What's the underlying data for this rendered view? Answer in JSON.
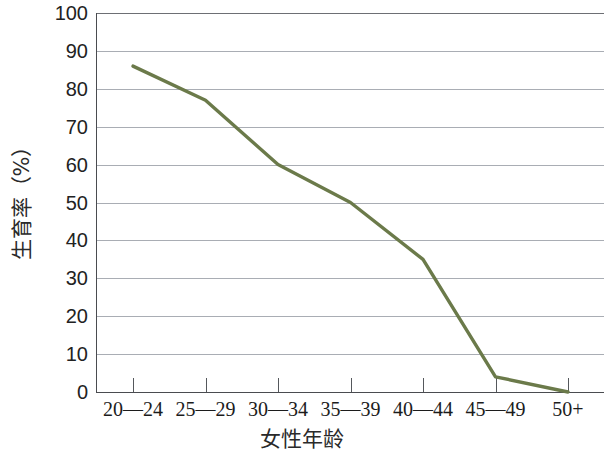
{
  "chart_data": {
    "type": "line",
    "title": "",
    "xlabel": "女性年龄",
    "ylabel": "生育率（%）",
    "categories": [
      "20—24",
      "25—29",
      "30—34",
      "35—39",
      "40—44",
      "45—49",
      "50+"
    ],
    "values": [
      86,
      77,
      60,
      50,
      35,
      4,
      0
    ],
    "series": [
      {
        "name": "生育率",
        "values": [
          86,
          77,
          60,
          50,
          35,
          4,
          0
        ],
        "color": "#6b7a4a"
      }
    ],
    "ylim": [
      0,
      100
    ],
    "ytick_labels": [
      "100",
      "90",
      "80",
      "70",
      "60",
      "50",
      "40",
      "30",
      "20",
      "10",
      "0"
    ],
    "ytick_values": [
      100,
      90,
      80,
      70,
      60,
      50,
      40,
      30,
      20,
      10,
      0
    ],
    "grid": true,
    "grid_axis": "y",
    "legend": "none",
    "legend_position": "none",
    "line_color": "#6b7a4a",
    "grid_color": "#a9adb4",
    "axis_color": "#4a4c50",
    "background_color": "#ffffff",
    "markers": false
  },
  "axes": {
    "y": {
      "title": "生育率（%）",
      "ticks": [
        "100",
        "90",
        "80",
        "70",
        "60",
        "50",
        "40",
        "30",
        "20",
        "10",
        "0"
      ]
    },
    "x": {
      "title": "女性年龄",
      "ticks": [
        "20—24",
        "25—29",
        "30—34",
        "35—39",
        "40—44",
        "45—49",
        "50+"
      ]
    }
  }
}
